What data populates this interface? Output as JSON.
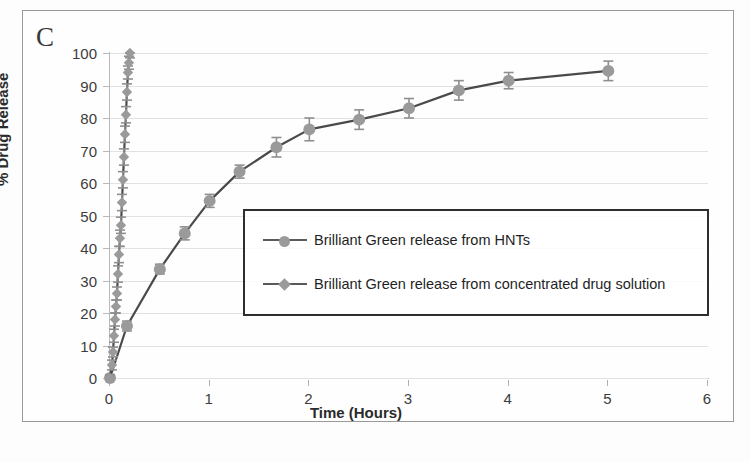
{
  "figure": {
    "panel_label": "C",
    "background_color": "#fdfdfd",
    "border_color": "#9a9a9a"
  },
  "colors": {
    "marker": "#9a9a9a",
    "line": "#4a4a4a",
    "error_bar": "#8f8f8f",
    "gridline": "#e2e2e6",
    "axis": "#b0b0b0",
    "text": "#2b2b2b"
  },
  "chart_data": {
    "type": "line",
    "title": "",
    "panel": "C",
    "xlabel": "Time (Hours)",
    "ylabel": "% Drug Release",
    "xlim": [
      0,
      6
    ],
    "ylim": [
      0,
      100
    ],
    "xticks": [
      0,
      1,
      2,
      3,
      4,
      5,
      6
    ],
    "yticks": [
      0,
      10,
      20,
      30,
      40,
      50,
      60,
      70,
      80,
      90,
      100
    ],
    "grid": true,
    "legend_position": "center",
    "error_bars": true,
    "series": [
      {
        "name": "Brilliant Green release from HNTs",
        "marker": "circle",
        "x": [
          0,
          0.17,
          0.5,
          0.75,
          1.0,
          1.3,
          1.67,
          2.0,
          2.5,
          3.0,
          3.5,
          4.0,
          5.0
        ],
        "y": [
          0,
          16,
          33.5,
          44.5,
          54.5,
          63.5,
          71,
          76.5,
          79.5,
          83,
          88.5,
          91.5,
          94.5
        ],
        "yerr": [
          0,
          1.5,
          1.5,
          2.0,
          2.0,
          2.0,
          3.0,
          3.5,
          3.0,
          3.0,
          3.0,
          2.5,
          3.0
        ]
      },
      {
        "name": "Brilliant Green release from concentrated drug solution",
        "marker": "diamond",
        "x": [
          0,
          0.02,
          0.03,
          0.04,
          0.05,
          0.06,
          0.07,
          0.08,
          0.09,
          0.1,
          0.11,
          0.12,
          0.13,
          0.14,
          0.15,
          0.16,
          0.17,
          0.18,
          0.19,
          0.2
        ],
        "y": [
          0,
          4,
          8,
          13,
          18,
          22,
          26,
          32,
          38,
          43,
          47,
          54,
          61,
          68,
          75,
          81,
          88,
          94,
          97,
          100
        ],
        "yerr": [
          1,
          1.5,
          1.5,
          2,
          2,
          2,
          2,
          2.5,
          2.5,
          2.5,
          2.5,
          2.5,
          2.5,
          2.5,
          2.5,
          2.5,
          2.5,
          2,
          2,
          1.5
        ]
      }
    ]
  },
  "legend": {
    "items": [
      {
        "label": "Brilliant Green release from HNTs",
        "marker": "circle"
      },
      {
        "label": "Brilliant Green release from concentrated drug solution",
        "marker": "diamond"
      }
    ]
  }
}
